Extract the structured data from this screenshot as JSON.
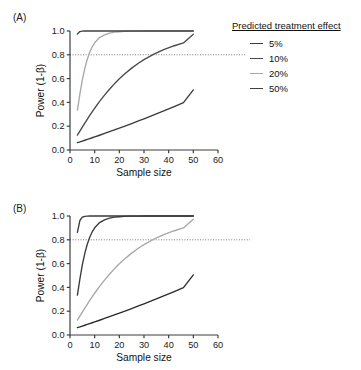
{
  "figure": {
    "width": 361,
    "height": 370,
    "background": "#ffffff"
  },
  "panels": [
    {
      "id": "A",
      "label": "(A)",
      "legend_title": "Predicted treatment effect",
      "legend_items": [
        {
          "label": "5%",
          "color": "#3a3a3a"
        },
        {
          "label": "10%",
          "color": "#4a4a4a"
        },
        {
          "label": "20%",
          "color": "#a8a8a8"
        },
        {
          "label": "50%",
          "color": "#404040"
        }
      ]
    },
    {
      "id": "B",
      "label": "(B)",
      "legend_title": "Control SD",
      "legend_items": [
        {
          "label": "20",
          "color": "#3a3a3a"
        },
        {
          "label": "40",
          "color": "#3a3a3a"
        },
        {
          "label": "80",
          "color": "#a8a8a8"
        },
        {
          "label": "160",
          "color": "#2b2b2b"
        }
      ]
    }
  ],
  "chart_data": [
    {
      "type": "line",
      "panel": "A",
      "title": "",
      "xlabel": "Sample size",
      "ylabel": "Power (1-β)",
      "xlim": [
        0,
        60
      ],
      "ylim": [
        0.0,
        1.0
      ],
      "xticks": [
        0,
        10,
        20,
        30,
        40,
        50,
        60
      ],
      "yticks": [
        0.0,
        0.2,
        0.4,
        0.6,
        0.8,
        1.0
      ],
      "ytick_labels": [
        "0.0",
        "0.2",
        "0.4",
        "0.6",
        "0.8",
        "1.0"
      ],
      "xtick_labels": [
        "0",
        "10",
        "20",
        "30",
        "40",
        "50",
        "60"
      ],
      "grid": false,
      "legend_position": "right",
      "reference_line": {
        "y": 0.8,
        "style": "dotted",
        "color": "#7a7a7a"
      },
      "x": [
        3,
        4,
        5,
        6,
        7,
        8,
        9,
        10,
        12,
        14,
        16,
        18,
        20,
        22,
        25,
        28,
        30,
        34,
        38,
        42,
        46,
        50
      ],
      "series": [
        {
          "name": "5%",
          "color": "#3a3a3a",
          "values": [
            0.062,
            0.068,
            0.075,
            0.082,
            0.089,
            0.096,
            0.103,
            0.11,
            0.124,
            0.139,
            0.154,
            0.169,
            0.184,
            0.199,
            0.222,
            0.246,
            0.262,
            0.295,
            0.328,
            0.362,
            0.398,
            0.505
          ]
        },
        {
          "name": "10%",
          "color": "#4a4a4a",
          "values": [
            0.125,
            0.158,
            0.192,
            0.225,
            0.258,
            0.29,
            0.321,
            0.351,
            0.408,
            0.461,
            0.51,
            0.556,
            0.598,
            0.636,
            0.688,
            0.733,
            0.759,
            0.805,
            0.843,
            0.874,
            0.9,
            0.972
          ]
        },
        {
          "name": "20%",
          "color": "#a8a8a8",
          "values": [
            0.335,
            0.47,
            0.59,
            0.686,
            0.763,
            0.822,
            0.867,
            0.901,
            0.945,
            0.968,
            0.982,
            0.99,
            0.994,
            0.997,
            0.999,
            0.999,
            1.0,
            1.0,
            1.0,
            1.0,
            1.0,
            1.0
          ]
        },
        {
          "name": "50%",
          "color": "#404040",
          "values": [
            0.975,
            0.995,
            0.999,
            1.0,
            1.0,
            1.0,
            1.0,
            1.0,
            1.0,
            1.0,
            1.0,
            1.0,
            1.0,
            1.0,
            1.0,
            1.0,
            1.0,
            1.0,
            1.0,
            1.0,
            1.0,
            1.0
          ]
        }
      ]
    },
    {
      "type": "line",
      "panel": "B",
      "title": "",
      "xlabel": "Sample size",
      "ylabel": "Power (1-β)",
      "xlim": [
        0,
        60
      ],
      "ylim": [
        0.0,
        1.0
      ],
      "xticks": [
        0,
        10,
        20,
        30,
        40,
        50,
        60
      ],
      "yticks": [
        0.0,
        0.2,
        0.4,
        0.6,
        0.8,
        1.0
      ],
      "ytick_labels": [
        "0.0",
        "0.2",
        "0.4",
        "0.6",
        "0.8",
        "1.0"
      ],
      "xtick_labels": [
        "0",
        "10",
        "20",
        "30",
        "40",
        "50",
        "60"
      ],
      "grid": false,
      "legend_position": "right",
      "reference_line": {
        "y": 0.8,
        "style": "dotted",
        "color": "#7a7a7a"
      },
      "x": [
        3,
        4,
        5,
        6,
        7,
        8,
        9,
        10,
        12,
        14,
        16,
        18,
        20,
        22,
        25,
        28,
        30,
        34,
        38,
        42,
        46,
        50
      ],
      "series": [
        {
          "name": "20",
          "color": "#3a3a3a",
          "values": [
            0.862,
            0.962,
            0.99,
            0.997,
            0.999,
            1.0,
            1.0,
            1.0,
            1.0,
            1.0,
            1.0,
            1.0,
            1.0,
            1.0,
            1.0,
            1.0,
            1.0,
            1.0,
            1.0,
            1.0,
            1.0,
            1.0
          ]
        },
        {
          "name": "40",
          "color": "#3a3a3a",
          "values": [
            0.335,
            0.47,
            0.59,
            0.686,
            0.763,
            0.822,
            0.867,
            0.901,
            0.945,
            0.968,
            0.982,
            0.99,
            0.994,
            0.997,
            0.999,
            0.999,
            1.0,
            1.0,
            1.0,
            1.0,
            1.0,
            1.0
          ]
        },
        {
          "name": "80",
          "color": "#a8a8a8",
          "values": [
            0.125,
            0.158,
            0.192,
            0.225,
            0.258,
            0.29,
            0.321,
            0.351,
            0.408,
            0.461,
            0.51,
            0.556,
            0.598,
            0.636,
            0.688,
            0.733,
            0.759,
            0.805,
            0.843,
            0.874,
            0.9,
            0.972
          ]
        },
        {
          "name": "160",
          "color": "#2b2b2b",
          "values": [
            0.062,
            0.068,
            0.075,
            0.082,
            0.089,
            0.096,
            0.103,
            0.11,
            0.124,
            0.139,
            0.154,
            0.169,
            0.184,
            0.199,
            0.222,
            0.246,
            0.262,
            0.295,
            0.328,
            0.362,
            0.398,
            0.505
          ]
        }
      ]
    }
  ]
}
